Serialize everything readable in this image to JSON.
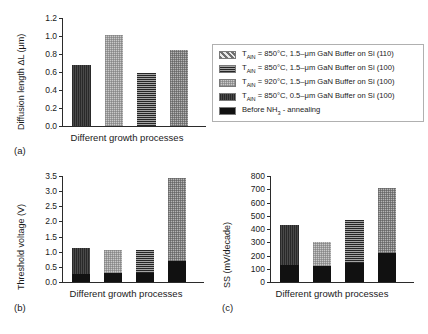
{
  "figure": {
    "xlabel_common": "Different growth processes"
  },
  "legend": {
    "entries": [
      {
        "swatch": "diagonal-hatch",
        "prefix": "T",
        "sub": "AlN",
        "text": " = 850°C, 1.5–μm GaN Buffer on Si (110)"
      },
      {
        "swatch": "horizontal-lines",
        "prefix": "T",
        "sub": "AlN",
        "text": " = 850°C, 1.5–μm GaN Buffer on Si (100)"
      },
      {
        "swatch": "checker-light",
        "prefix": "T",
        "sub": "AlN",
        "text": " = 920°C, 1.5–μm GaN Buffer on Si (100)"
      },
      {
        "swatch": "vertical-hatch",
        "prefix": "T",
        "sub": "AlN",
        "text": " = 850°C, 0.5–μm GaN Buffer on Si (100)"
      },
      {
        "swatch": "black-solid",
        "prefix": "Before NH",
        "sub": "3",
        "text": " - annealing"
      }
    ]
  },
  "chart_data": [
    {
      "id": "a",
      "type": "bar",
      "panel_tag": "(a)",
      "title": "",
      "ylabel": "Diffusion length ΔL (μm)",
      "xlabel": "Different growth processes",
      "ylim": [
        0.0,
        1.2
      ],
      "yticks": [
        "0.0",
        "0.2",
        "0.4",
        "0.6",
        "0.8",
        "1.0",
        "1.2"
      ],
      "ytick_values": [
        0.0,
        0.2,
        0.4,
        0.6,
        0.8,
        1.0,
        1.2
      ],
      "categories": [
        "1",
        "2",
        "3",
        "4"
      ],
      "values": [
        0.68,
        1.01,
        0.59,
        0.85
      ],
      "patterns": [
        "vertical-hatch",
        "checker-light",
        "horizontal-lines",
        "checker-mid"
      ],
      "grid": false
    },
    {
      "id": "b",
      "type": "bar",
      "panel_tag": "(b)",
      "title": "",
      "ylabel": "Threshold voltage (V)",
      "xlabel": "Different growth processes",
      "ylim": [
        0.0,
        3.5
      ],
      "yticks": [
        "0.0",
        "0.5",
        "1.0",
        "1.5",
        "2.0",
        "2.5",
        "3.0",
        "3.5"
      ],
      "ytick_values": [
        0.0,
        0.5,
        1.0,
        1.5,
        2.0,
        2.5,
        3.0,
        3.5
      ],
      "categories": [
        "1",
        "2",
        "3",
        "4"
      ],
      "stacked": true,
      "series": [
        {
          "name": "Before NH3 - annealing",
          "pattern": "black-solid",
          "values": [
            0.28,
            0.3,
            0.29,
            0.68
          ]
        },
        {
          "name": "After annealing",
          "patterns": [
            "vertical-hatch",
            "checker-light",
            "horizontal-lines",
            "checker-mid"
          ],
          "values": [
            0.84,
            0.76,
            0.76,
            2.74
          ]
        }
      ],
      "totals": [
        1.12,
        1.06,
        1.05,
        3.42
      ],
      "grid": false
    },
    {
      "id": "c",
      "type": "bar",
      "panel_tag": "(c)",
      "title": "",
      "ylabel": "SS (mV/decade)",
      "xlabel": "Different growth processes",
      "ylim": [
        0,
        800
      ],
      "yticks": [
        "0",
        "100",
        "200",
        "300",
        "400",
        "500",
        "600",
        "700",
        "800"
      ],
      "ytick_values": [
        0,
        100,
        200,
        300,
        400,
        500,
        600,
        700,
        800
      ],
      "categories": [
        "1",
        "2",
        "3",
        "4"
      ],
      "stacked": true,
      "series": [
        {
          "name": "Before NH3 - annealing",
          "pattern": "black-solid",
          "values": [
            128,
            120,
            142,
            218
          ]
        },
        {
          "name": "After annealing",
          "patterns": [
            "vertical-hatch",
            "checker-light",
            "horizontal-lines",
            "checker-mid"
          ],
          "values": [
            302,
            180,
            323,
            492
          ]
        }
      ],
      "totals": [
        430,
        300,
        465,
        710
      ],
      "grid": false
    }
  ]
}
